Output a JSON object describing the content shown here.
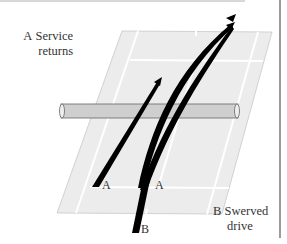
{
  "labels": {
    "a_letter": "A",
    "a_line1": "Service",
    "a_line2": "returns",
    "b_letter": "B",
    "b_line1": "Swerved",
    "b_line2": "drive"
  },
  "markers": {
    "a1": "A",
    "a2": "A",
    "b": "B"
  },
  "colors": {
    "court": "#ececec",
    "court_lines": "#ffffff",
    "net": "#cfcfcf",
    "arrows": "#000000"
  }
}
